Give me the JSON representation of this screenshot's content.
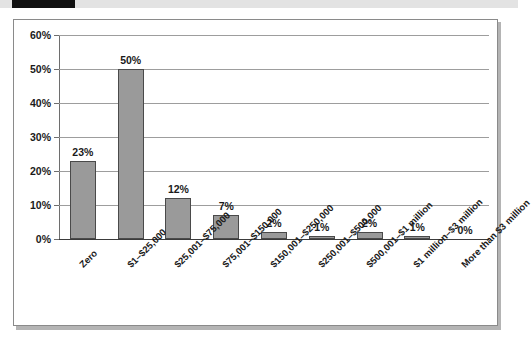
{
  "figure": {
    "header_mark": "black-rule",
    "colors": {
      "bar_fill": "#9a9a9a",
      "bar_stroke": "#4a4a4a",
      "gridline": "#9d9d9d",
      "axis": "#6e6e6e",
      "text": "#1a1a1a",
      "frame": "#8a8a8a",
      "header_mark": "#111111"
    }
  },
  "chart_data": {
    "type": "bar",
    "title": "",
    "xlabel": "",
    "ylabel": "",
    "ylim": [
      0,
      60
    ],
    "ytick_values": [
      0,
      10,
      20,
      30,
      40,
      50,
      60
    ],
    "ytick_labels": [
      "0%",
      "10%",
      "20%",
      "30%",
      "40%",
      "50%",
      "60%"
    ],
    "grid": true,
    "legend": "none",
    "label_rotation_degrees": -45,
    "categories": [
      "Zero",
      "$1–$25,000",
      "$25,001–$75,000",
      "$75,001–$150,000",
      "$150,001–$250,000",
      "$250,001–$500,000",
      "$500,001–$1 million",
      "$1 million–$3 million",
      "More than $3 million"
    ],
    "values": [
      23,
      50,
      12,
      7,
      2,
      1,
      2,
      1,
      0
    ],
    "data_labels": [
      "23%",
      "50%",
      "12%",
      "7%",
      "2%",
      "1%",
      "2%",
      "1%",
      "0%"
    ]
  }
}
